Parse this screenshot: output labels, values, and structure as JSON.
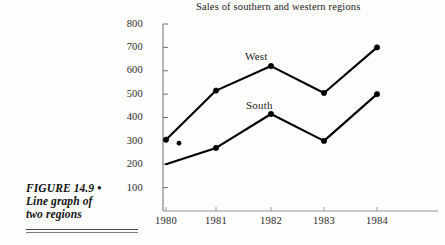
{
  "figure": {
    "caption_lines": [
      "FIGURE  14.9 •",
      "Line graph of",
      "two regions"
    ]
  },
  "chart_data": {
    "type": "line",
    "title": "Sales of southern and western regions",
    "xlabel": "",
    "ylabel": "",
    "categories": [
      "1980",
      "1981",
      "1982",
      "1983",
      "1984"
    ],
    "series": [
      {
        "name": "West",
        "values": [
          305,
          515,
          620,
          505,
          700
        ],
        "color": "#000000",
        "marker": "circle",
        "label_text": "West"
      },
      {
        "name": "South",
        "values": [
          200,
          270,
          415,
          300,
          500
        ],
        "color": "#000000",
        "marker": "circle",
        "label_text": "South"
      }
    ],
    "yticks": [
      100,
      200,
      300,
      400,
      500,
      600,
      700,
      800
    ],
    "ylim": [
      0,
      800
    ],
    "grid": false,
    "legend": "inline-series-labels",
    "annotations": [
      {
        "name": "stray-print-dot",
        "x": "1980",
        "value": 290
      }
    ]
  }
}
